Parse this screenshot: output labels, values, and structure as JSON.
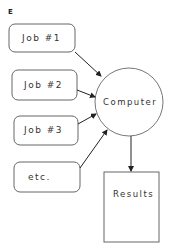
{
  "figure": {
    "panel_label": "E",
    "jobs": [
      {
        "label": "Job #1"
      },
      {
        "label": "Job #2"
      },
      {
        "label": "Job #3"
      },
      {
        "label": "etc."
      }
    ],
    "computer": {
      "label": "Computer"
    },
    "results": {
      "label": "Results"
    },
    "colors": {
      "stroke": "#555555",
      "arrow": "#222222",
      "text": "#333333"
    }
  }
}
